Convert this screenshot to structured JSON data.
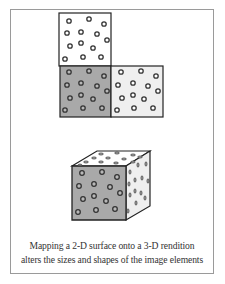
{
  "figure": {
    "caption": {
      "line1": "Mapping a 2-D surface onto a 3-D rendition",
      "line2": "alters the sizes and shapes of the image elements"
    },
    "colors": {
      "frame_border": "#9a9a9a",
      "dark_face": "#a9a9a9",
      "light_face": "#efefef",
      "white_face": "#ffffff",
      "outline": "#222222",
      "dot_stroke": "#333333"
    },
    "net_2d": {
      "squares": [
        {
          "name": "top-white-square",
          "x": 59,
          "y": 13,
          "w": 52,
          "h": 53,
          "fill": "#ffffff"
        },
        {
          "name": "bottom-left-gray-square",
          "x": 60,
          "y": 66,
          "w": 51,
          "h": 51,
          "fill": "#a9a9a9"
        },
        {
          "name": "bottom-right-light-square",
          "x": 111,
          "y": 66,
          "w": 52,
          "h": 51,
          "fill": "#efefef"
        }
      ]
    },
    "cube_3d": {
      "front_face": "72,166 126,166 126,220 72,220",
      "top_face": "72,166 97,151 150,151 126,166",
      "right_face": "126,166 150,151 150,206 126,220"
    }
  }
}
